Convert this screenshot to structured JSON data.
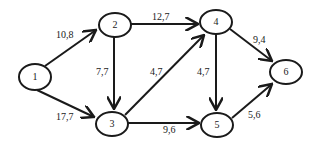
{
  "diagram": {
    "type": "directed weighted graph",
    "nodes": [
      {
        "id": "1",
        "label": "1",
        "cx": 35,
        "cy": 77
      },
      {
        "id": "2",
        "label": "2",
        "cx": 114,
        "cy": 25
      },
      {
        "id": "3",
        "label": "3",
        "cx": 112,
        "cy": 124
      },
      {
        "id": "4",
        "label": "4",
        "cx": 216,
        "cy": 22
      },
      {
        "id": "5",
        "label": "5",
        "cx": 217,
        "cy": 125
      },
      {
        "id": "6",
        "label": "6",
        "cx": 285,
        "cy": 71
      }
    ],
    "edges": [
      {
        "from": "1",
        "to": "2",
        "weight": "10,8"
      },
      {
        "from": "1",
        "to": "3",
        "weight": "17,7"
      },
      {
        "from": "2",
        "to": "4",
        "weight": "12,7"
      },
      {
        "from": "2",
        "to": "3",
        "weight": "7,7"
      },
      {
        "from": "3",
        "to": "4",
        "weight": "4,7"
      },
      {
        "from": "3",
        "to": "5",
        "weight": "9,6"
      },
      {
        "from": "4",
        "to": "5",
        "weight": "4,7"
      },
      {
        "from": "4",
        "to": "6",
        "weight": "9,4"
      },
      {
        "from": "5",
        "to": "6",
        "weight": "5,6"
      }
    ]
  }
}
